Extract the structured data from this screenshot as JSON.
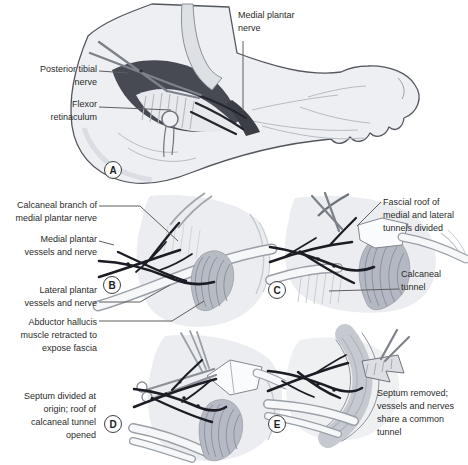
{
  "panels": {
    "a": {
      "letter": "A",
      "labels": {
        "medial_plantar_nerve": "Medial plantar\nnerve",
        "posterior_tibial_nerve": "Posterior tibial\nnerve",
        "flexor_retinaculum": "Flexor\nretinaculum"
      }
    },
    "b": {
      "letter": "B",
      "labels": {
        "calcaneal_branch": "Calcaneal branch of\nmedial plantar nerve",
        "medial_plantar_vessels": "Medial plantar\nvessels and nerve",
        "lateral_plantar_vessels": "Lateral plantar\nvessels and nerve",
        "abductor_hallucis": "Abductor hallucis\nmuscle retracted to\nexpose fascia"
      }
    },
    "c": {
      "letter": "C",
      "labels": {
        "fascial_roof": "Fascial roof of\nmedial and lateral\ntunnels divided",
        "calcaneal_tunnel": "Calcaneal\ntunnel"
      }
    },
    "d": {
      "letter": "D",
      "labels": {
        "septum_divided": "Septum divided at\norigin; roof of\ncalcaneal tunnel\nopened"
      }
    },
    "e": {
      "letter": "E",
      "labels": {
        "septum_removed": "Septum removed;\nvessels and nerves\nshare a common\ntunnel"
      }
    }
  },
  "colors": {
    "background": "#ffffff",
    "ink_outline": "#53565e",
    "skin": "#edeff2",
    "wound_dark": "#474a53",
    "vessel_nerve": "#1b1c24",
    "tendon_white": "#f6f7f9",
    "muscle_gray": "#b7bbc4",
    "metal_gray": "#7d828a",
    "label_text": "#2b2b2b",
    "leader_line": "#5f5f5f"
  }
}
